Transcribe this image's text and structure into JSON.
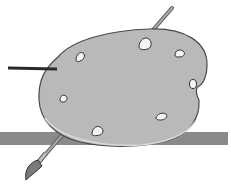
{
  "illustration": {
    "subject": "painter-palette-with-brush",
    "colors": {
      "background": "#ffffff",
      "palette_fill": "#b9b9b9",
      "palette_outline": "#4a4a4a",
      "shelf_bar": "#8a8a8a",
      "paint_blob": "#f4f4f4",
      "brush_handle": "#8c8c8c",
      "brush_tip": "#7a7a7a",
      "pointer_line": "#2a2a2a"
    },
    "paint_blobs": [
      {
        "x": 145,
        "y": 44,
        "r": 6
      },
      {
        "x": 180,
        "y": 53,
        "r": 5
      },
      {
        "x": 80,
        "y": 57,
        "r": 5
      },
      {
        "x": 193,
        "y": 83,
        "r": 4
      },
      {
        "x": 64,
        "y": 98,
        "r": 4
      },
      {
        "x": 162,
        "y": 116,
        "r": 5
      },
      {
        "x": 98,
        "y": 130,
        "r": 6
      }
    ]
  }
}
